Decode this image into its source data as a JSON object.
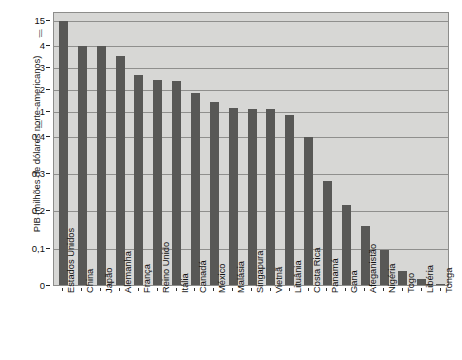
{
  "chart_data": {
    "type": "bar",
    "title": "",
    "xlabel": "",
    "ylabel": "PIB (milhões de dólares norte-americanos)",
    "legend": null,
    "grid": true,
    "axis_breaks": [
      {
        "between": [
          "1",
          "0,4"
        ],
        "symbol": "//"
      },
      {
        "between": [
          "15",
          "4"
        ],
        "symbol": "//"
      }
    ],
    "ytick_labels": [
      "15",
      "4",
      "3",
      "2",
      "1",
      "0,4",
      "0,3",
      "0,2",
      "0,1",
      "0"
    ],
    "ytick_values": [
      15,
      4,
      3,
      2,
      1,
      0.4,
      0.3,
      0.2,
      0.1,
      0
    ],
    "categories": [
      "Estados Unidos",
      "China",
      "Japão",
      "Alemanha",
      "França",
      "Reino Unido",
      "Itália",
      "Canadá",
      "México",
      "Malásia",
      "Singapura",
      "Vietnã",
      "Lituânia",
      "Costa Rica",
      "Panamá",
      "Gana",
      "Afeganistão",
      "Nigéria",
      "Togo",
      "Libéria",
      "Tonga"
    ],
    "values": [
      15.1,
      4.2,
      4.1,
      3.55,
      2.7,
      2.45,
      2.4,
      1.85,
      1.45,
      1.2,
      1.15,
      1.15,
      0.94,
      0.4,
      0.28,
      0.215,
      0.16,
      0.097,
      0.04,
      0.02,
      0.005
    ],
    "bar_color": "#585856",
    "plot_background": "#d7d7d5",
    "gridline_color": "#8f8f8d"
  }
}
